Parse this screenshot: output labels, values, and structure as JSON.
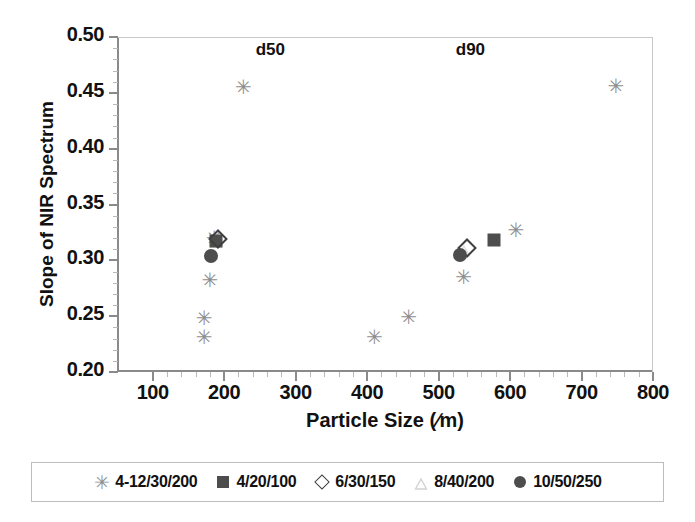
{
  "chart_data": {
    "type": "scatter",
    "title": "",
    "xlabel": "Particle Size (∕m)",
    "ylabel": "Slope of NIR Spectrum",
    "xlim": [
      50,
      800
    ],
    "ylim": [
      0.2,
      0.5
    ],
    "xticks": [
      100,
      200,
      300,
      400,
      500,
      600,
      700,
      800
    ],
    "yticks": [
      "0.20",
      "0.25",
      "0.30",
      "0.35",
      "0.40",
      "0.45",
      "0.50"
    ],
    "xtick_labels": [
      "100",
      "200",
      "300",
      "400",
      "500",
      "600",
      "700",
      "800"
    ],
    "ytick_labels": [
      "0.50",
      "0.45",
      "0.40",
      "0.35",
      "0.30",
      "0.25",
      "0.20"
    ],
    "grid": false,
    "legend_position": "below",
    "annotations": [
      {
        "text": "d50",
        "x": 272,
        "y": 0.488
      },
      {
        "text": "d90",
        "x": 552,
        "y": 0.488
      }
    ],
    "series": [
      {
        "name": "4-12/30/200",
        "marker": "asterisk",
        "color": "#8e8e8e",
        "points": [
          {
            "x": 227,
            "y": 0.455
          },
          {
            "x": 186,
            "y": 0.32
          },
          {
            "x": 180,
            "y": 0.282
          },
          {
            "x": 172,
            "y": 0.248
          },
          {
            "x": 172,
            "y": 0.231
          },
          {
            "x": 410,
            "y": 0.231
          },
          {
            "x": 458,
            "y": 0.249
          },
          {
            "x": 535,
            "y": 0.285
          },
          {
            "x": 608,
            "y": 0.327
          },
          {
            "x": 748,
            "y": 0.456
          }
        ]
      },
      {
        "name": "4/20/100",
        "marker": "filled-square",
        "color": "#4d4d4d",
        "points": [
          {
            "x": 189,
            "y": 0.317
          },
          {
            "x": 578,
            "y": 0.318
          }
        ]
      },
      {
        "name": "6/30/150",
        "marker": "open-diamond",
        "color": "#3f3f3f",
        "points": [
          {
            "x": 191,
            "y": 0.319
          },
          {
            "x": 540,
            "y": 0.311
          }
        ]
      },
      {
        "name": "8/40/200",
        "marker": "open-triangle",
        "color": "#e2e2e2",
        "points": [
          {
            "x": 188,
            "y": 0.318
          },
          {
            "x": 536,
            "y": 0.31
          }
        ]
      },
      {
        "name": "10/50/250",
        "marker": "filled-circle",
        "color": "#4d4d4d",
        "points": [
          {
            "x": 182,
            "y": 0.304
          },
          {
            "x": 530,
            "y": 0.305
          }
        ]
      }
    ]
  },
  "legend": {
    "items": [
      {
        "label": "4-12/30/200",
        "marker": "asterisk"
      },
      {
        "label": "4/20/100",
        "marker": "filled-square"
      },
      {
        "label": "6/30/150",
        "marker": "open-diamond"
      },
      {
        "label": "8/40/200",
        "marker": "open-triangle"
      },
      {
        "label": "10/50/250",
        "marker": "filled-circle"
      }
    ]
  }
}
